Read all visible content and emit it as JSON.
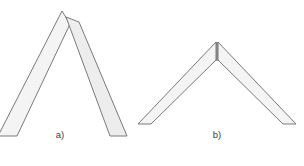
{
  "figure": {
    "background_color": "#ffffff",
    "width": 304,
    "height": 166,
    "caption_faint": "",
    "panels": [
      {
        "id": "a",
        "label": "a)",
        "joint_type": "lapped-overlap-joint",
        "description": "Steep narrow inverted-V chevron; right band laps over the left band below the apex",
        "apex_style": "overlapping",
        "apex_point": {
          "x": 62,
          "y": 12
        },
        "band_width_px": 13,
        "left_leg_end": {
          "x": -2,
          "y": 134
        },
        "right_leg_end": {
          "x": 124,
          "y": 134
        },
        "included_angle_deg": 52
      },
      {
        "id": "b",
        "label": "b)",
        "joint_type": "butt-joint",
        "description": "Wide shallow inverted-V chevron with a vertical butt seam at the apex",
        "apex_style": "butt-seam",
        "apex_point": {
          "x": 217,
          "y": 43
        },
        "band_width_px": 12,
        "left_leg_end": {
          "x": 148,
          "y": 122
        },
        "right_leg_end": {
          "x": 290,
          "y": 122
        },
        "included_angle_deg": 118,
        "seam": {
          "x": 217,
          "y_top": 43,
          "y_bottom": 61
        }
      }
    ],
    "style": {
      "fill_color": "#f4f4f4",
      "fill_color_overlap": "#ededed",
      "stroke_color": "#6b6b6b",
      "seam_color": "#555555",
      "label_color": "#3c3c3c"
    }
  }
}
